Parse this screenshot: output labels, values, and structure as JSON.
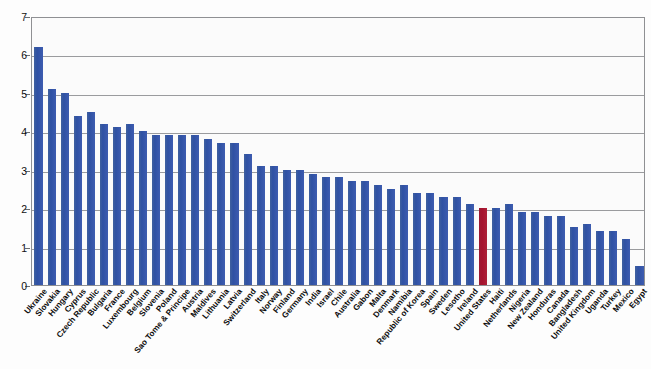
{
  "chart_data": {
    "type": "bar",
    "title": "",
    "subtitle": "",
    "xlabel": "",
    "ylabel": "",
    "ylim": [
      0,
      7
    ],
    "yticks": [
      0,
      1,
      2,
      3,
      4,
      5,
      6,
      7
    ],
    "ytick_labels": [
      "0",
      "1",
      "2",
      "3",
      "4",
      "5",
      "6",
      "7"
    ],
    "grid": true,
    "legend": "none",
    "bar_color": "#3355a8",
    "highlight_color": "#a31832",
    "highlight_category": "United States",
    "categories": [
      "Ukraine",
      "Slovakia",
      "Hungary",
      "Cyprus",
      "Czech Republic",
      "Bulgaria",
      "France",
      "Luxembourg",
      "Belgium",
      "Slovenia",
      "Poland",
      "Sao Tome & Principe",
      "Austria",
      "Maldives",
      "Lithuania",
      "Latvia",
      "Switzerland",
      "Italy",
      "Norway",
      "Finland",
      "Germany",
      "India",
      "Israel",
      "Chile",
      "Australia",
      "Gabon",
      "Malta",
      "Denmark",
      "Namibia",
      "Republic of Korea",
      "Spain",
      "Sweden",
      "Lesotho",
      "Ireland",
      "United States",
      "Haiti",
      "Netherlands",
      "Nigeria",
      "New Zealand",
      "Honduras",
      "Canada",
      "Bangladesh",
      "United Kingdom",
      "Uganda",
      "Turkey",
      "Mexico",
      "Egypt"
    ],
    "values": [
      6.2,
      5.1,
      5.0,
      4.4,
      4.5,
      4.2,
      4.1,
      4.2,
      4.0,
      3.9,
      3.9,
      3.9,
      3.9,
      3.8,
      3.7,
      3.7,
      3.4,
      3.1,
      3.1,
      3.0,
      3.0,
      2.9,
      2.8,
      2.8,
      2.7,
      2.7,
      2.6,
      2.5,
      2.6,
      2.4,
      2.4,
      2.3,
      2.3,
      2.1,
      2.0,
      2.0,
      2.1,
      1.9,
      1.9,
      1.8,
      1.8,
      1.5,
      1.6,
      1.4,
      1.4,
      1.2,
      0.5
    ]
  }
}
